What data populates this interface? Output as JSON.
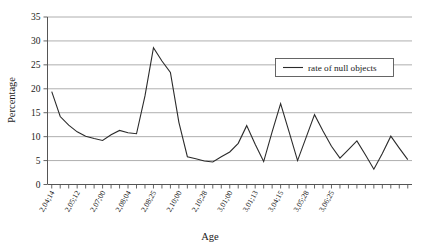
{
  "chart_data": {
    "type": "line",
    "title": "",
    "xlabel": "Age",
    "ylabel": "Percentage",
    "ylim": [
      0,
      35
    ],
    "yticks": [
      0,
      5,
      10,
      15,
      20,
      25,
      30,
      35
    ],
    "grid": true,
    "legend_position": "top-right",
    "legend_entries": [
      "rate of null objects"
    ],
    "x_tick_labels": [
      "2,04;14",
      "2,05;12",
      "2,07;00",
      "2,08;04",
      "2,08;25",
      "2,10;00",
      "2,10;28",
      "3,01;00",
      "3,01;13",
      "3,04;15",
      "3,05;28",
      "3,06;25"
    ],
    "x_label_interval": 3,
    "series": [
      {
        "name": "rate of null objects",
        "color": "#2b2b2b",
        "values": [
          19.4,
          14.2,
          12.4,
          11.0,
          10.1,
          9.6,
          9.2,
          10.4,
          11.3,
          10.8,
          10.6,
          18.5,
          28.6,
          25.8,
          23.4,
          13.0,
          5.8,
          5.4,
          4.9,
          4.7,
          5.8,
          6.8,
          8.6,
          12.3,
          8.4,
          4.8,
          11.0,
          16.9,
          11.0,
          5.0,
          9.8,
          14.6,
          11.2,
          8.0,
          5.5,
          7.3,
          9.1,
          6.2,
          3.2,
          6.5,
          10.1,
          7.6,
          5.2
        ]
      }
    ],
    "n_points": 43
  },
  "axes": {
    "y_title": "Percentage",
    "x_title": "Age"
  },
  "legend": {
    "label": "rate of null objects"
  },
  "colors": {
    "line": "#2b2b2b",
    "grid": "#9a9a9a",
    "axis": "#555555",
    "background": "#ffffff"
  }
}
